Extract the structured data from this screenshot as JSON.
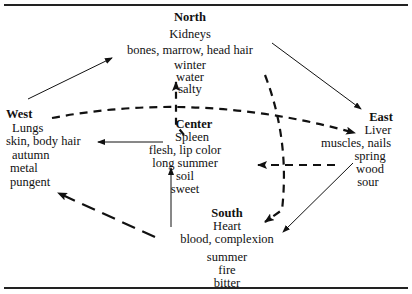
{
  "diagram": {
    "type": "five-phases-correspondence",
    "nodes": {
      "north": {
        "title": "North",
        "organ": "Kidneys",
        "tissue": "bones, marrow, head hair",
        "season": "winter",
        "element": "water",
        "taste": "salty"
      },
      "west": {
        "title": "West",
        "organ": "Lungs",
        "tissue": "skin, body hair",
        "season": "autumn",
        "element": "metal",
        "taste": "pungent"
      },
      "center": {
        "title": "Center",
        "organ": "Spleen",
        "tissue": "flesh, lip color",
        "season": "long summer",
        "element": "soil",
        "taste": "sweet"
      },
      "east": {
        "title": "East",
        "organ": "Liver",
        "tissue": "muscles, nails",
        "season": "spring",
        "element": "wood",
        "taste": "sour"
      },
      "south": {
        "title": "South",
        "organ": "Heart",
        "tissue": "blood, complexion",
        "season": "summer",
        "element": "fire",
        "taste": "bitter"
      }
    },
    "edges": [
      {
        "from": "west",
        "to": "north",
        "style": "solid"
      },
      {
        "from": "north",
        "to": "east",
        "style": "solid"
      },
      {
        "from": "east",
        "to": "south",
        "style": "solid"
      },
      {
        "from": "south",
        "to": "center",
        "style": "solid"
      },
      {
        "from": "center",
        "to": "west",
        "style": "solid"
      },
      {
        "from": "west",
        "to": "east",
        "style": "dashed"
      },
      {
        "from": "east",
        "to": "center",
        "style": "dashed"
      },
      {
        "from": "center",
        "to": "north",
        "style": "dashed"
      },
      {
        "from": "north",
        "to": "south",
        "style": "dashed"
      },
      {
        "from": "south",
        "to": "west",
        "style": "dashed"
      }
    ]
  }
}
